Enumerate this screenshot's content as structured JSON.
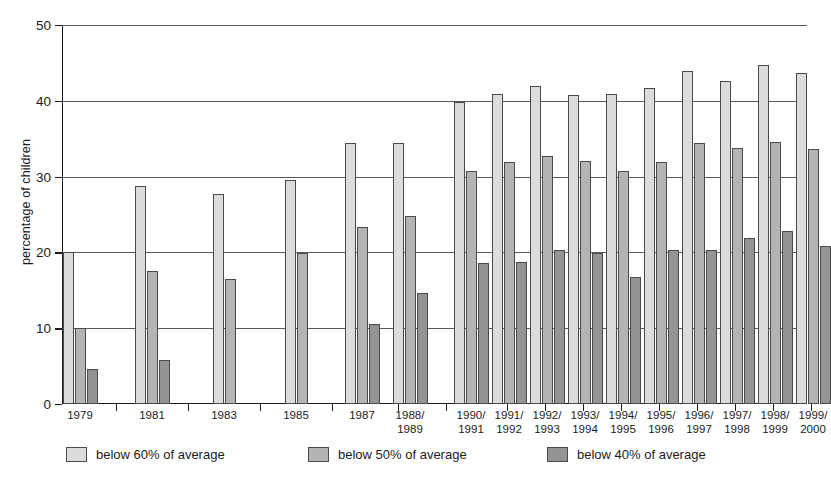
{
  "chart_data": {
    "type": "bar",
    "title": "",
    "xlabel": "",
    "ylabel": "percentage of children",
    "ylim": [
      0,
      50
    ],
    "yticks": [
      0,
      10,
      20,
      30,
      40,
      50
    ],
    "grid": true,
    "legend_position": "bottom",
    "categories": [
      "1979",
      "1981",
      "1983",
      "1985",
      "1987",
      "1988/\n1989",
      "1990/\n1991",
      "1991/\n1992",
      "1992/\n1993",
      "1993/\n1994",
      "1994/\n1995",
      "1995/\n1996",
      "1996/\n1997",
      "1997/\n1998",
      "1998/\n1999",
      "1999/\n2000"
    ],
    "series": [
      {
        "name": "below 60% of average",
        "color": "#dcdcdc",
        "values": [
          20.0,
          28.7,
          27.7,
          29.6,
          34.5,
          34.5,
          39.8,
          40.9,
          41.9,
          40.8,
          40.9,
          41.7,
          43.9,
          42.6,
          44.7,
          43.7
        ]
      },
      {
        "name": "below 50% of average",
        "color": "#b4b4b4",
        "values": [
          10.0,
          17.5,
          16.5,
          19.9,
          23.4,
          24.8,
          30.8,
          31.9,
          32.7,
          32.0,
          30.8,
          31.9,
          34.5,
          33.8,
          34.6,
          33.7
        ]
      },
      {
        "name": "below 40% of average",
        "color": "#949494",
        "values": [
          4.6,
          5.8,
          null,
          null,
          10.6,
          14.7,
          18.6,
          18.7,
          20.3,
          19.9,
          16.8,
          20.3,
          20.3,
          21.9,
          22.8,
          20.9
        ]
      }
    ]
  },
  "legend": {
    "items": [
      {
        "label": "below 60% of average",
        "swatch": "light-gray-swatch"
      },
      {
        "label": "below 50% of average",
        "swatch": "medium-gray-swatch"
      },
      {
        "label": "below 40% of average",
        "swatch": "dark-gray-swatch"
      }
    ]
  },
  "axis": {
    "y_title": "percentage of children",
    "y_tick_labels": [
      "0",
      "10",
      "20",
      "30",
      "40",
      "50"
    ]
  },
  "colors": {
    "series_below_60": "#dcdcdc",
    "series_below_50": "#b4b4b4",
    "series_below_40": "#949494",
    "axis": "#1b1b1b",
    "gridline": "#595959",
    "background": "#ffffff"
  }
}
